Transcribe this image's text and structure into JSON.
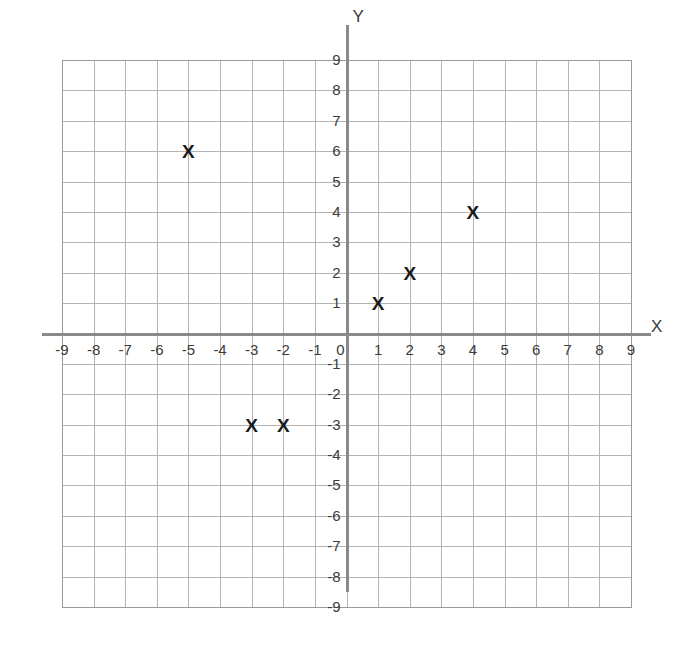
{
  "chart_data": {
    "type": "scatter",
    "title": "",
    "xlabel": "X",
    "ylabel": "Y",
    "xlim": [
      -9,
      9
    ],
    "ylim": [
      -9,
      9
    ],
    "grid": true,
    "legend": null,
    "marker": "X",
    "x_ticks": [
      -9,
      -8,
      -7,
      -6,
      -5,
      -4,
      -3,
      -2,
      -1,
      0,
      1,
      2,
      3,
      4,
      5,
      6,
      7,
      8,
      9
    ],
    "y_ticks": [
      9,
      8,
      7,
      6,
      5,
      4,
      3,
      2,
      1,
      0,
      -1,
      -2,
      -3,
      -4,
      -5,
      -6,
      -7,
      -8,
      -9
    ],
    "x_tick_labels": [
      "-9",
      "-8",
      "-7",
      "-6",
      "-5",
      "-4",
      "-3",
      "-2",
      "-1",
      "0",
      "1",
      "2",
      "3",
      "4",
      "5",
      "6",
      "7",
      "8",
      "9"
    ],
    "y_tick_labels": [
      "9",
      "8",
      "7",
      "6",
      "5",
      "4",
      "3",
      "2",
      "1",
      "0",
      "-1",
      "-2",
      "-3",
      "-4",
      "-5",
      "-6",
      "-7",
      "-8",
      "-9"
    ],
    "points": [
      {
        "x": -5,
        "y": 6,
        "label": "X"
      },
      {
        "x": 1,
        "y": 1,
        "label": "X"
      },
      {
        "x": 2,
        "y": 2,
        "label": "X"
      },
      {
        "x": 4,
        "y": 4,
        "label": "X"
      },
      {
        "x": -3,
        "y": -3,
        "label": "X"
      },
      {
        "x": -2,
        "y": -3,
        "label": "X"
      }
    ],
    "colors": {
      "grid": "#b4b4b4",
      "border": "#9a9a9a",
      "axis": "#8a8a8a",
      "marker": "#1a1a1a",
      "label": "#3b3b3b",
      "background": "#ffffff"
    }
  }
}
